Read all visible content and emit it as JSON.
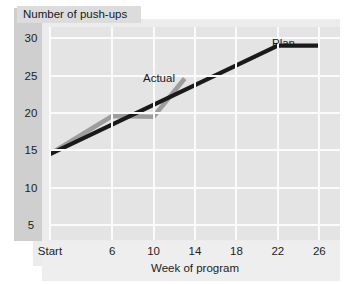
{
  "chart_data": {
    "type": "line",
    "title": "Number of push-ups",
    "xlabel": "Week of program",
    "ylabel": "Number of push-ups",
    "xlim": [
      0,
      28
    ],
    "ylim": [
      3,
      31.5
    ],
    "grid": true,
    "legend_position": "inline-annotations",
    "x_tick_labels": [
      "Start",
      "6",
      "10",
      "14",
      "18",
      "22",
      "26"
    ],
    "x_tick_values": [
      0,
      6,
      10,
      14,
      18,
      22,
      26
    ],
    "y_tick_labels": [
      "30",
      "25",
      "20",
      "15",
      "10",
      "5"
    ],
    "y_tick_values": [
      30,
      25,
      20,
      15,
      10,
      5
    ],
    "series": [
      {
        "name": "Plan",
        "color": "#1a1a1a",
        "x": [
          0,
          22,
          26
        ],
        "values": [
          14.5,
          29,
          29
        ]
      },
      {
        "name": "Actual",
        "color": "#9d9d9d",
        "x": [
          0,
          6,
          10,
          13
        ],
        "values": [
          14.5,
          19.6,
          19.5,
          24.6
        ]
      }
    ],
    "annotations": [
      {
        "text": "Actual",
        "x": 11.2,
        "y": 25.6
      },
      {
        "text": "Plan",
        "x": 21.4,
        "y": 30.4
      }
    ]
  },
  "colors": {
    "plan_line": "#1a1a1a",
    "actual_line": "#9d9d9d",
    "plot_background": "#e4e4e5",
    "panel_background": "#ececed",
    "gridline": "#fbfbfb",
    "y_band": "#cfcfd0",
    "title_chip": "#dcdcdd",
    "axis_strip": "#eeeeef"
  }
}
